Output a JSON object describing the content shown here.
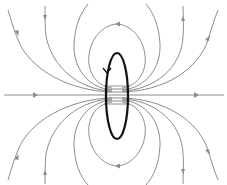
{
  "diagram": {
    "title": "",
    "colors": {
      "background": "#ffffff",
      "field_lines": "#8c8c8c",
      "current_loop": "#111111"
    },
    "elements": {
      "current_loop": {
        "shape": "ellipse",
        "cx": 117,
        "cy": 95,
        "rx": 11,
        "ry": 43,
        "current_direction_arrow": "downward on left side"
      },
      "axis_line": {
        "y": 95,
        "direction": "left-to-right"
      },
      "field_line_count_upper": 5,
      "field_line_count_lower": 5
    },
    "labels": []
  }
}
